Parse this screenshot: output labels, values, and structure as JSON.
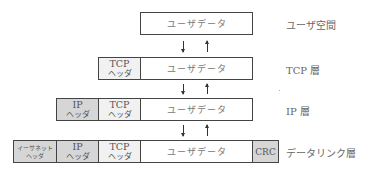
{
  "diagram": {
    "layers": [
      {
        "label": "ユーザ空間",
        "cells": [
          {
            "text": "ユーザデータ",
            "fill": "#ffffff"
          }
        ]
      },
      {
        "label": "TCP 層",
        "cells": [
          {
            "line1": "TCP",
            "line2": "ヘッダ",
            "fill": "#f1f1f1"
          },
          {
            "text": "ユーザデータ",
            "fill": "#ffffff"
          }
        ]
      },
      {
        "label": "IP 層",
        "cells": [
          {
            "line1": "IP",
            "line2": "ヘッダ",
            "fill": "#d6d6d6"
          },
          {
            "line1": "TCP",
            "line2": "ヘッダ",
            "fill": "#f1f1f1"
          },
          {
            "text": "ユーザデータ",
            "fill": "#ffffff"
          }
        ]
      },
      {
        "label": "データリンク層",
        "cells": [
          {
            "line1": "イーサネット",
            "line2": "ヘッダ",
            "fill": "#d6d6d6"
          },
          {
            "line1": "IP",
            "line2": "ヘッダ",
            "fill": "#d6d6d6"
          },
          {
            "line1": "TCP",
            "line2": "ヘッダ",
            "fill": "#f1f1f1"
          },
          {
            "text": "ユーザデータ",
            "fill": "#ffffff"
          },
          {
            "text": "CRC",
            "fill": "#d6d6d6"
          }
        ]
      }
    ],
    "arrows": [
      "down-arrow",
      "up-arrow"
    ]
  }
}
